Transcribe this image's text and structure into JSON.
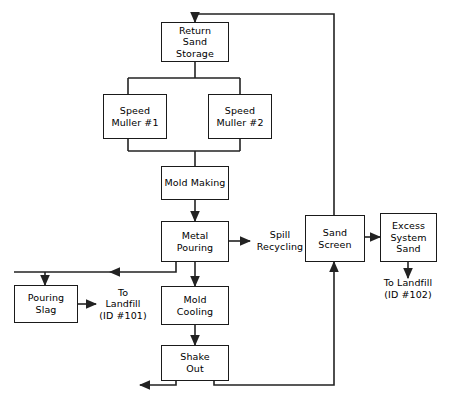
{
  "diagram": {
    "line_color": "#222222",
    "box_border_color": "#1a1a1a",
    "background": "#ffffff"
  },
  "nodes": {
    "return_sand_storage": {
      "label": "Return\nSand\nStorage"
    },
    "speed_muller_1": {
      "label": "Speed\nMuller #1"
    },
    "speed_muller_2": {
      "label": "Speed\nMuller #2"
    },
    "mold_making": {
      "label": "Mold Making"
    },
    "metal_pouring": {
      "label": "Metal Pouring"
    },
    "sand_screen": {
      "label": "Sand\nScreen"
    },
    "excess_system_sand": {
      "label": "Excess\nSystem\nSand"
    },
    "pouring_slag": {
      "label": "Pouring\nSlag"
    },
    "mold_cooling": {
      "label": "Mold\nCooling"
    },
    "shake_out": {
      "label": "Shake\nOut"
    }
  },
  "labels": {
    "spill_recycling": {
      "text": "Spill\nRecycling"
    },
    "to_landfill_101": {
      "text": "To\nLandfill\n(ID #101)"
    },
    "to_landfill_102": {
      "text": "To Landfill\n(ID #102)"
    }
  }
}
